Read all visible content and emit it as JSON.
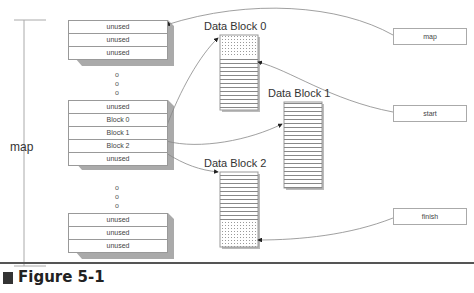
{
  "figure": {
    "label": "Figure 5-1"
  },
  "bracket_label": "map",
  "stacks": [
    {
      "cells": [
        "unused",
        "unused",
        "unused"
      ]
    },
    {
      "cells": [
        "unused",
        "Block 0",
        "Block 1",
        "Block 2",
        "unused"
      ]
    },
    {
      "cells": [
        "unused",
        "unused",
        "unused"
      ]
    }
  ],
  "ellipsis": "o",
  "data_blocks": [
    {
      "title": "Data Block 0"
    },
    {
      "title": "Data Block 1"
    },
    {
      "title": "Data Block 2"
    }
  ],
  "pointers": [
    {
      "label": "map"
    },
    {
      "label": "start"
    },
    {
      "label": "finish"
    }
  ],
  "colors": {
    "line": "#999999",
    "shadow": "#aaaaaa",
    "text": "#333333"
  }
}
